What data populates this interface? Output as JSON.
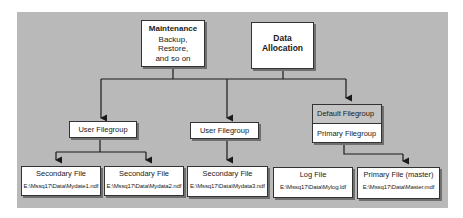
{
  "top": {
    "maintenance": {
      "title": "Maintenance",
      "lines": [
        "Backup,",
        "Restore,",
        "and so on"
      ]
    },
    "data_allocation": {
      "title": "Data",
      "title2": "Allocation"
    }
  },
  "filegroups": [
    {
      "label": "User Filegroup"
    },
    {
      "label": "User Filegroup"
    },
    {
      "header": "Default Filegroup",
      "label": "Primary Filegroup"
    }
  ],
  "files": [
    {
      "title": "Secondary File",
      "path": "E:\\Mssq17\\Data\\Mydate1.ndf"
    },
    {
      "title": "Secondary File",
      "path": "E:\\Mssq17\\Data\\Mydata2.ndf"
    },
    {
      "title": "Secondary File",
      "path": "E:\\Mssq17\\Data\\Mydata3.ndf"
    },
    {
      "title": "Log File",
      "path": "E:\\Mssq17\\Data\\Mylog.ldf"
    },
    {
      "title": "Primary File (master)",
      "path": "E:\\Mssq17\\Data\\Master.mdf"
    }
  ],
  "colors": {
    "background": "#b9b9b9",
    "box": "#ffffff",
    "header": "#c4c4c4",
    "line": "#1a1a1a"
  }
}
